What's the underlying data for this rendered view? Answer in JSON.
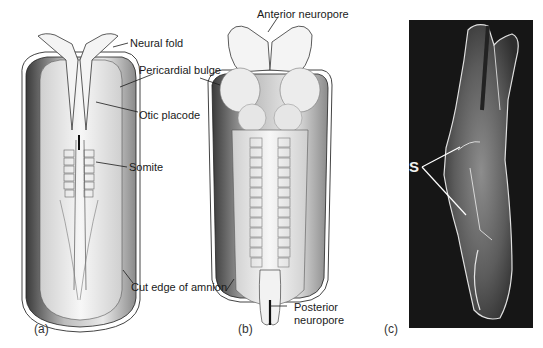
{
  "figure": {
    "panels": [
      {
        "id": "a",
        "label": "(a)"
      },
      {
        "id": "b",
        "label": "(b)"
      },
      {
        "id": "c",
        "label": "(c)"
      }
    ],
    "annotations": {
      "neural_fold": "Neural fold",
      "pericardial_bulge": "Pericardial bulge",
      "otic_placode": "Otic placode",
      "somite": "Somite",
      "cut_edge_of_amnion": "Cut edge of amnion",
      "anterior_neuropore": "Anterior neuropore",
      "posterior_neuropore_line1": "Posterior",
      "posterior_neuropore_line2": "neuropore",
      "somites_s": "S"
    },
    "colors": {
      "ink": "#1a1a1a",
      "sem_background": "#151515",
      "tissue_light": "#eeeeee",
      "tissue_shade": "#9a9a9a"
    }
  }
}
